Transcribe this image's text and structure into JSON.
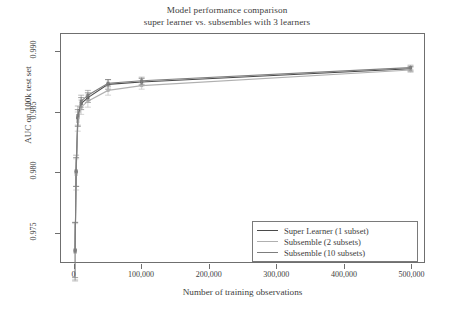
{
  "chart_data": {
    "type": "line",
    "title": "Model performance comparison",
    "subtitle": "super learner vs. subsembles with 3 learners",
    "xlabel": "Number of training observations",
    "ylabel": "AUC on 100k test set",
    "xlim": [
      -20000,
      520000
    ],
    "ylim": [
      0.9725,
      0.9915
    ],
    "grid": false,
    "legend_position": "bottom-right",
    "xticks": [
      0,
      100000,
      200000,
      300000,
      400000,
      500000
    ],
    "xtick_labels": [
      "0",
      "100,000",
      "200,000",
      "300,000",
      "400,000",
      "500,000"
    ],
    "yticks": [
      0.975,
      0.98,
      0.985,
      0.99
    ],
    "ytick_labels": [
      "0.975",
      "0.980",
      "0.985",
      "0.990"
    ],
    "errorbars": true,
    "series": [
      {
        "name": "Super Learner (1 subset)",
        "color": "#4a4a4a",
        "x": [
          1000,
          2500,
          5000,
          10000,
          20000,
          50000,
          100000,
          500000
        ],
        "y": [
          0.9735,
          0.98,
          0.9845,
          0.9857,
          0.9862,
          0.9873,
          0.9875,
          0.9886
        ],
        "yerr": [
          0.0023,
          0.0012,
          0.0007,
          0.0005,
          0.0004,
          0.0004,
          0.0003,
          0.0002
        ]
      },
      {
        "name": "Subsemble (2 subsets)",
        "color": "#b0b0b0",
        "x": [
          1000,
          2500,
          5000,
          10000,
          20000,
          50000,
          100000,
          500000
        ],
        "y": [
          0.9733,
          0.9798,
          0.9842,
          0.9854,
          0.9859,
          0.9868,
          0.9872,
          0.9885
        ],
        "yerr": [
          0.0024,
          0.0013,
          0.0008,
          0.0006,
          0.0005,
          0.0004,
          0.0003,
          0.0002
        ]
      },
      {
        "name": "Subsemble (10 subsets)",
        "color": "#7d7d7d",
        "x": [
          1000,
          2500,
          5000,
          10000,
          20000,
          50000,
          100000,
          500000
        ],
        "y": [
          0.9734,
          0.9801,
          0.9847,
          0.9859,
          0.9864,
          0.9874,
          0.9876,
          0.9887
        ],
        "yerr": [
          0.0024,
          0.0013,
          0.0008,
          0.0005,
          0.0004,
          0.0003,
          0.0003,
          0.0002
        ]
      }
    ]
  },
  "axes": {
    "y_label": "AUC on 100k test set",
    "x_label": "Number of training observations"
  },
  "legend": {
    "entries": [
      {
        "label": "Super Learner (1 subset)",
        "color": "#4a4a4a"
      },
      {
        "label": "Subsemble (2 subsets)",
        "color": "#b0b0b0"
      },
      {
        "label": "Subsemble (10 subsets)",
        "color": "#7d7d7d"
      }
    ]
  },
  "colors": {
    "frame": "#6f6f6f",
    "text": "#3d3d3d",
    "background": "#ffffff"
  }
}
